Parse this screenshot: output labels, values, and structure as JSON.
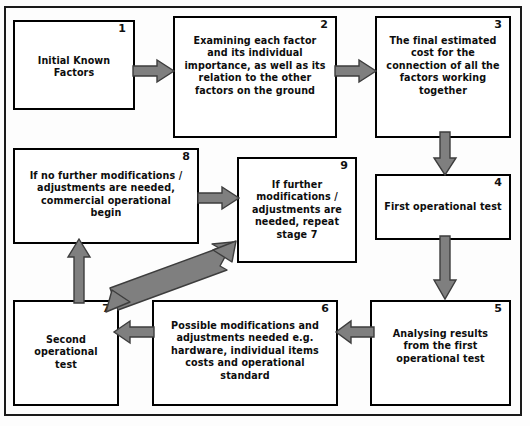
{
  "diagram": {
    "frame_color": "#1a1a1a",
    "box_border_color": "#000000",
    "box_fill": "#ffffff",
    "arrow_fill": "#7f7f7f",
    "arrow_stroke": "#3d3d3d",
    "nodes": [
      {
        "id": "node-1",
        "number": "1",
        "text": "Initial Known\nFactors"
      },
      {
        "id": "node-2",
        "number": "2",
        "text": "Examining each factor\nand its individual\nimportance, as well as its\nrelation to the other\nfactors on the ground"
      },
      {
        "id": "node-3",
        "number": "3",
        "text": "The final estimated\ncost  for the\nconnection of all the\nfactors working\ntogether"
      },
      {
        "id": "node-4",
        "number": "4",
        "text": "First operational test"
      },
      {
        "id": "node-5",
        "number": "5",
        "text": "Analysing results\nfrom the first\noperational test"
      },
      {
        "id": "node-6",
        "number": "6",
        "text": "Possible modifications and\nadjustments needed e.g.\nhardware, individual items\ncosts and operational\nstandard"
      },
      {
        "id": "node-7",
        "number": "7",
        "text": "Second\noperational\ntest"
      },
      {
        "id": "node-8",
        "number": "8",
        "text": "If no further modifications /\nadjustments are needed,\ncommercial operational\nbegin"
      },
      {
        "id": "node-9",
        "number": "9",
        "text": "If further\nmodifications /\nadjustments are\nneeded, repeat\nstage 7"
      }
    ],
    "connectors": [
      {
        "id": "arrow-1-to-2",
        "from": "1",
        "to": "2",
        "direction": "right"
      },
      {
        "id": "arrow-2-to-3",
        "from": "2",
        "to": "3",
        "direction": "right"
      },
      {
        "id": "arrow-3-to-4",
        "from": "3",
        "to": "4",
        "direction": "down"
      },
      {
        "id": "arrow-4-to-5",
        "from": "4",
        "to": "5",
        "direction": "down"
      },
      {
        "id": "arrow-5-to-6",
        "from": "5",
        "to": "6",
        "direction": "left"
      },
      {
        "id": "arrow-6-to-7",
        "from": "6",
        "to": "7",
        "direction": "left"
      },
      {
        "id": "arrow-7-to-8",
        "from": "7",
        "to": "8",
        "direction": "up"
      },
      {
        "id": "arrow-8-to-9",
        "from": "8",
        "to": "9",
        "direction": "right"
      },
      {
        "id": "arrow-9-to-7",
        "from": "9",
        "to": "7",
        "direction": "diagonal-double"
      }
    ]
  }
}
